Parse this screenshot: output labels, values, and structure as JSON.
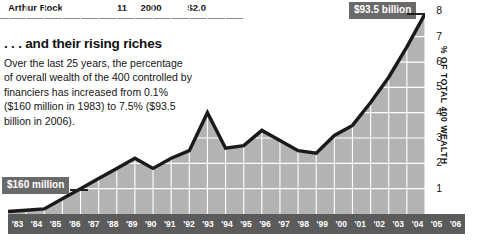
{
  "table_fragment": {
    "name": "Arthur Rock",
    "rank": "11",
    "year": "2000",
    "value": "$2.0"
  },
  "headline": ". . . and their rising riches",
  "deck": "Over the last 25 years, the percentage of overall wealth of the 400 controlled by financiers has increased from 0.1% ($160 million in 1983) to 7.5% ($93.5 billion in 2006).",
  "callouts": {
    "high": "$93.5 billion",
    "low": "$160 million"
  },
  "colors": {
    "area_fill": "#b3b3b3",
    "line": "#1a1a1a",
    "grid": "#ffffff",
    "axis_band": "#5b5b5b",
    "callout_bg": "#6a6a6a"
  },
  "chart_data": {
    "type": "area",
    "title": ". . . and their rising riches",
    "xlabel": "",
    "ylabel": "% OF TOTAL 400 WEALTH",
    "ylim": [
      0,
      8
    ],
    "yticks": [
      1,
      2,
      3,
      4,
      5,
      6,
      7,
      8
    ],
    "grid": true,
    "legend": "none",
    "categories": [
      "'83",
      "'84",
      "'85",
      "'86",
      "'87",
      "'88",
      "'89",
      "'90",
      "'91",
      "'92",
      "'93",
      "'94",
      "'95",
      "'96",
      "'97",
      "'98",
      "'99",
      "'00",
      "'01",
      "'02",
      "'03",
      "'04",
      "'05",
      "'06"
    ],
    "values": [
      0.1,
      0.15,
      0.2,
      0.6,
      1.0,
      1.4,
      1.8,
      2.2,
      1.8,
      2.2,
      2.5,
      4.0,
      2.6,
      2.7,
      3.3,
      2.9,
      2.5,
      2.4,
      3.1,
      3.5,
      4.4,
      5.4,
      6.6,
      7.9
    ],
    "annotations": [
      {
        "label": "$160 million",
        "x": "'83",
        "value": 0.1
      },
      {
        "label": "$93.5 billion",
        "x": "'06",
        "value": 7.5
      }
    ]
  }
}
